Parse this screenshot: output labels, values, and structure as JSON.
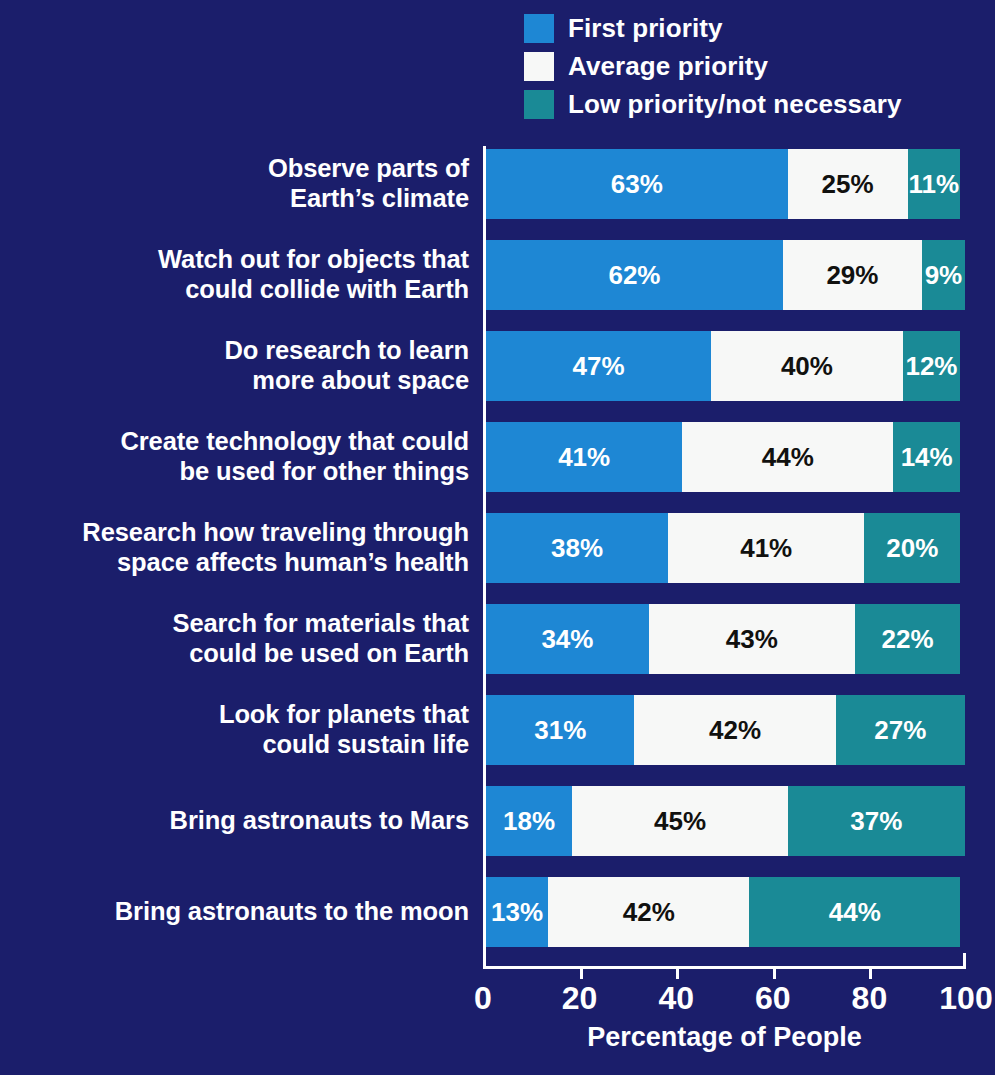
{
  "chart_data": {
    "type": "bar",
    "subtype": "horizontal-stacked-100",
    "title": "",
    "xlabel": "Percentage of People",
    "ylabel": "",
    "xlim": [
      0,
      100
    ],
    "xticks": [
      "0",
      "20",
      "40",
      "60",
      "80",
      "100"
    ],
    "grid": false,
    "legend_position": "top-right",
    "categories": [
      "Observe parts of\nEarth’s climate",
      "Watch out for objects that\ncould collide with Earth",
      "Do research to learn\nmore about space",
      "Create technology that could\nbe used for other things",
      "Research how traveling through\nspace affects human’s health",
      "Search for materials that\ncould be used on Earth",
      "Look for planets that\ncould sustain life",
      "Bring astronauts to Mars",
      "Bring astronauts to the moon"
    ],
    "series": [
      {
        "name": "First priority",
        "color": "#1e87d4",
        "text_color": "#ffffff",
        "values": [
          63,
          62,
          47,
          41,
          38,
          34,
          31,
          18,
          13
        ],
        "labels": [
          "63%",
          "62%",
          "47%",
          "41%",
          "38%",
          "34%",
          "31%",
          "18%",
          "13%"
        ]
      },
      {
        "name": "Average priority",
        "color": "#f7f8f7",
        "text_color": "#11110f",
        "values": [
          25,
          29,
          40,
          44,
          41,
          43,
          42,
          45,
          42
        ],
        "labels": [
          "25%",
          "29%",
          "40%",
          "44%",
          "41%",
          "43%",
          "42%",
          "45%",
          "42%"
        ]
      },
      {
        "name": "Low priority/not necessary",
        "color": "#1a8a96",
        "text_color": "#ffffff",
        "values": [
          11,
          9,
          12,
          14,
          20,
          22,
          27,
          37,
          44
        ],
        "labels": [
          "11%",
          "9%",
          "12%",
          "14%",
          "20%",
          "22%",
          "27%",
          "37%",
          "44%"
        ]
      }
    ]
  },
  "legend": {
    "items": [
      {
        "label": "First priority",
        "color": "#1e87d4"
      },
      {
        "label": "Average priority",
        "color": "#f7f8f7"
      },
      {
        "label": "Low priority/not necessary",
        "color": "#1a8a96"
      }
    ]
  },
  "axis": {
    "x_title": "Percentage of People",
    "ticks": [
      "0",
      "20",
      "40",
      "60",
      "80",
      "100"
    ]
  },
  "colors": {
    "background": "#1b1e6b",
    "first_priority": "#1e87d4",
    "average_priority": "#f7f8f7",
    "low_priority": "#1a8a96",
    "axis": "#ffffff",
    "label_text": "#ffffff",
    "dark_text": "#11110f"
  }
}
